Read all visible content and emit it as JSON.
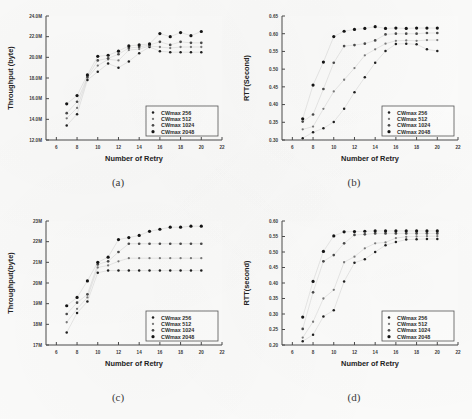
{
  "figure": {
    "panels": [
      {
        "id": "a",
        "caption": "(a)",
        "chart_data": {
          "type": "scatter",
          "title": "",
          "xlabel": "Number of Retry",
          "ylabel": "Throughput (byte)",
          "xlim": [
            5,
            22
          ],
          "ylim": [
            12,
            24
          ],
          "xticks": [
            6,
            8,
            10,
            12,
            14,
            16,
            18,
            20,
            22
          ],
          "xticklabels": [
            "6",
            "8",
            "10",
            "12",
            "14",
            "16",
            "18",
            "20",
            "22"
          ],
          "yticks": [
            12,
            14,
            16,
            18,
            20,
            22,
            24
          ],
          "yticklabels": [
            "12.0M",
            "14.0M",
            "16.0M",
            "18.0M",
            "20.0M",
            "22.0M",
            "24.0M"
          ],
          "grid": false,
          "legend_position": "lower-right",
          "x": [
            7,
            8,
            9,
            10,
            11,
            12,
            13,
            14,
            15,
            16,
            17,
            18,
            19,
            20
          ],
          "series": [
            {
              "name": "CWmax  256",
              "values": [
                13.4,
                14.5,
                17.8,
                18.6,
                19.4,
                19.0,
                19.6,
                20.4,
                21.0,
                20.6,
                20.5,
                20.5,
                20.5,
                20.5
              ]
            },
            {
              "name": "CWmax  512",
              "values": [
                14.1,
                15.1,
                18.0,
                19.2,
                19.8,
                19.7,
                20.7,
                20.8,
                21.1,
                21.0,
                20.9,
                21.0,
                21.0,
                21.0
              ]
            },
            {
              "name": "CWmax 1024",
              "values": [
                14.6,
                15.7,
                18.1,
                19.7,
                19.9,
                20.3,
                20.9,
                21.0,
                21.2,
                21.5,
                21.2,
                21.5,
                21.4,
                21.4
              ]
            },
            {
              "name": "CWmax 2048",
              "values": [
                15.5,
                16.3,
                18.3,
                20.1,
                20.2,
                20.6,
                21.1,
                21.2,
                21.3,
                22.3,
                22.0,
                22.4,
                22.1,
                22.5
              ]
            }
          ]
        }
      },
      {
        "id": "b",
        "caption": "(b)",
        "chart_data": {
          "type": "scatter",
          "title": "",
          "xlabel": "Number of Retry",
          "ylabel": "RTT(Second)",
          "xlim": [
            5,
            22
          ],
          "ylim": [
            0.3,
            0.65
          ],
          "xticks": [
            6,
            8,
            10,
            12,
            14,
            16,
            18,
            20,
            22
          ],
          "xticklabels": [
            "6",
            "8",
            "10",
            "12",
            "14",
            "16",
            "18",
            "20",
            "22"
          ],
          "yticks": [
            0.3,
            0.35,
            0.4,
            0.45,
            0.5,
            0.55,
            0.6,
            0.65
          ],
          "yticklabels": [
            "0.30",
            "0.35",
            "0.40",
            "0.45",
            "0.50",
            "0.55",
            "0.60",
            "0.65"
          ],
          "grid": false,
          "legend_position": "lower-right",
          "x": [
            7,
            8,
            9,
            10,
            11,
            12,
            13,
            14,
            15,
            16,
            17,
            18,
            19,
            20
          ],
          "series": [
            {
              "name": "CWmax  256",
              "values": [
                0.305,
                0.322,
                0.333,
                0.351,
                0.388,
                0.435,
                0.477,
                0.518,
                0.551,
                0.571,
                0.572,
                0.57,
                0.556,
                0.551
              ]
            },
            {
              "name": "CWmax  512",
              "values": [
                0.33,
                0.338,
                0.388,
                0.437,
                0.47,
                0.503,
                0.539,
                0.556,
                0.572,
                0.58,
                0.581,
                0.58,
                0.582,
                0.582
              ]
            },
            {
              "name": "CWmax 1024",
              "values": [
                0.352,
                0.372,
                0.444,
                0.518,
                0.565,
                0.568,
                0.572,
                0.581,
                0.598,
                0.6,
                0.6,
                0.6,
                0.602,
                0.602
              ]
            },
            {
              "name": "CWmax 2048",
              "values": [
                0.36,
                0.455,
                0.52,
                0.592,
                0.607,
                0.612,
                0.615,
                0.62,
                0.615,
                0.616,
                0.615,
                0.616,
                0.616,
                0.616
              ]
            }
          ]
        }
      },
      {
        "id": "c",
        "caption": "(c)",
        "chart_data": {
          "type": "scatter",
          "title": "",
          "xlabel": "Number of Retry",
          "ylabel": "Throughput(byte)",
          "xlim": [
            5,
            22
          ],
          "ylim": [
            17,
            23
          ],
          "xticks": [
            6,
            8,
            10,
            12,
            14,
            16,
            18,
            20,
            22
          ],
          "xticklabels": [
            "6",
            "8",
            "10",
            "12",
            "14",
            "16",
            "18",
            "20",
            "22"
          ],
          "yticks": [
            17,
            18,
            19,
            20,
            21,
            22,
            23
          ],
          "yticklabels": [
            "17M",
            "18M",
            "19M",
            "20M",
            "21M",
            "22M",
            "23M"
          ],
          "grid": false,
          "legend_position": "lower-right",
          "x": [
            7,
            8,
            9,
            10,
            11,
            12,
            13,
            14,
            15,
            16,
            17,
            18,
            19,
            20
          ],
          "series": [
            {
              "name": "CWmax  256",
              "values": [
                17.6,
                18.55,
                19.1,
                20.5,
                20.6,
                20.6,
                20.6,
                20.6,
                20.6,
                20.6,
                20.6,
                20.6,
                20.6,
                20.6
              ]
            },
            {
              "name": "CWmax  512",
              "values": [
                18.1,
                18.75,
                19.3,
                20.75,
                20.85,
                21.05,
                21.2,
                21.2,
                21.2,
                21.2,
                21.2,
                21.2,
                21.2,
                21.2
              ]
            },
            {
              "name": "CWmax 1024",
              "values": [
                18.5,
                19.05,
                19.45,
                20.9,
                21.05,
                21.5,
                21.9,
                21.9,
                21.9,
                21.9,
                21.9,
                21.9,
                21.9,
                21.9
              ]
            },
            {
              "name": "CWmax 2048",
              "values": [
                18.9,
                19.3,
                20.1,
                21.0,
                21.25,
                22.1,
                22.2,
                22.3,
                22.5,
                22.6,
                22.7,
                22.7,
                22.75,
                22.75
              ]
            }
          ]
        }
      },
      {
        "id": "d",
        "caption": "(d)",
        "chart_data": {
          "type": "scatter",
          "title": "",
          "xlabel": "Number of Retry",
          "ylabel": "RTT(second)",
          "xlim": [
            5,
            22
          ],
          "ylim": [
            0.2,
            0.6
          ],
          "xticks": [
            6,
            8,
            10,
            12,
            14,
            16,
            18,
            20,
            22
          ],
          "xticklabels": [
            "6",
            "8",
            "10",
            "12",
            "14",
            "16",
            "18",
            "20",
            "22"
          ],
          "yticks": [
            0.2,
            0.25,
            0.3,
            0.35,
            0.4,
            0.45,
            0.5,
            0.55,
            0.6
          ],
          "yticklabels": [
            "0.20",
            "0.25",
            "0.30",
            "0.35",
            "0.40",
            "0.45",
            "0.50",
            "0.55",
            "0.60"
          ],
          "grid": false,
          "legend_position": "lower-right",
          "x": [
            7,
            8,
            9,
            10,
            11,
            12,
            13,
            14,
            15,
            16,
            17,
            18,
            19,
            20
          ],
          "series": [
            {
              "name": "CWmax  256",
              "values": [
                0.212,
                0.233,
                0.292,
                0.312,
                0.405,
                0.465,
                0.477,
                0.5,
                0.522,
                0.532,
                0.54,
                0.541,
                0.542,
                0.542
              ]
            },
            {
              "name": "CWmax  512",
              "values": [
                0.224,
                0.275,
                0.35,
                0.378,
                0.467,
                0.485,
                0.512,
                0.528,
                0.531,
                0.545,
                0.549,
                0.55,
                0.551,
                0.551
              ]
            },
            {
              "name": "CWmax 1024",
              "values": [
                0.252,
                0.37,
                0.47,
                0.49,
                0.528,
                0.555,
                0.557,
                0.56,
                0.56,
                0.56,
                0.56,
                0.56,
                0.56,
                0.56
              ]
            },
            {
              "name": "CWmax 2048",
              "values": [
                0.29,
                0.405,
                0.502,
                0.552,
                0.565,
                0.566,
                0.567,
                0.568,
                0.568,
                0.568,
                0.568,
                0.568,
                0.568,
                0.568
              ]
            }
          ]
        }
      }
    ]
  }
}
